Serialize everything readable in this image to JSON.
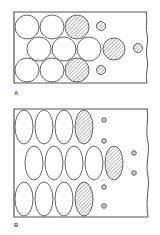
{
  "figure": {
    "colors": {
      "stroke": "#555555",
      "hatch": "#666666",
      "background": "#ffffff"
    },
    "panels": [
      {
        "id": "A",
        "label": "A",
        "shape": "circle",
        "box": {
          "x": 14,
          "y": 12,
          "right_wavy_x": 147,
          "bottom": 83
        },
        "large_elements": [
          {
            "cx": 27,
            "cy": 27,
            "r": 12,
            "hatched": false
          },
          {
            "cx": 52,
            "cy": 27,
            "r": 12,
            "hatched": false
          },
          {
            "cx": 77,
            "cy": 27,
            "r": 12,
            "hatched": true
          },
          {
            "cx": 39,
            "cy": 49,
            "r": 12,
            "hatched": false
          },
          {
            "cx": 64,
            "cy": 49,
            "r": 12,
            "hatched": false
          },
          {
            "cx": 89,
            "cy": 49,
            "r": 12,
            "hatched": false
          },
          {
            "cx": 114,
            "cy": 49,
            "r": 11,
            "hatched": true
          },
          {
            "cx": 27,
            "cy": 70,
            "r": 12,
            "hatched": false
          },
          {
            "cx": 52,
            "cy": 70,
            "r": 12,
            "hatched": false
          },
          {
            "cx": 77,
            "cy": 70,
            "r": 12,
            "hatched": true
          }
        ],
        "small_elements": [
          {
            "cx": 101,
            "cy": 26,
            "r": 4.5
          },
          {
            "cx": 138,
            "cy": 48,
            "r": 4.5
          },
          {
            "cx": 101,
            "cy": 70,
            "r": 4.5
          }
        ]
      },
      {
        "id": "B",
        "label": "B",
        "shape": "ellipse",
        "box": {
          "x": 14,
          "y": 109,
          "right_wavy_x": 148,
          "bottom": 217
        },
        "large_elements": [
          {
            "cx": 24,
            "cy": 127,
            "rx": 9,
            "ry": 17,
            "hatched": false
          },
          {
            "cx": 44,
            "cy": 127,
            "rx": 9,
            "ry": 17,
            "hatched": false
          },
          {
            "cx": 64,
            "cy": 127,
            "rx": 9,
            "ry": 17,
            "hatched": false
          },
          {
            "cx": 84,
            "cy": 127,
            "rx": 9,
            "ry": 17,
            "hatched": true
          },
          {
            "cx": 34,
            "cy": 163,
            "rx": 9,
            "ry": 17,
            "hatched": false
          },
          {
            "cx": 54,
            "cy": 163,
            "rx": 9,
            "ry": 17,
            "hatched": false
          },
          {
            "cx": 74,
            "cy": 163,
            "rx": 9,
            "ry": 17,
            "hatched": false
          },
          {
            "cx": 94,
            "cy": 163,
            "rx": 9,
            "ry": 17,
            "hatched": false
          },
          {
            "cx": 114,
            "cy": 163,
            "rx": 9,
            "ry": 17,
            "hatched": true
          },
          {
            "cx": 24,
            "cy": 199,
            "rx": 9,
            "ry": 17,
            "hatched": false
          },
          {
            "cx": 44,
            "cy": 199,
            "rx": 9,
            "ry": 17,
            "hatched": false
          },
          {
            "cx": 64,
            "cy": 199,
            "rx": 9,
            "ry": 17,
            "hatched": false
          },
          {
            "cx": 84,
            "cy": 199,
            "rx": 9,
            "ry": 17,
            "hatched": true
          }
        ],
        "small_elements": [
          {
            "cx": 104,
            "cy": 120,
            "r": 2.3
          },
          {
            "cx": 104,
            "cy": 141,
            "r": 2.3
          },
          {
            "cx": 104,
            "cy": 187,
            "r": 2.3
          },
          {
            "cx": 104,
            "cy": 206,
            "r": 2.3
          },
          {
            "cx": 134,
            "cy": 153,
            "r": 2.3
          },
          {
            "cx": 134,
            "cy": 173,
            "r": 2.3
          }
        ]
      }
    ]
  }
}
